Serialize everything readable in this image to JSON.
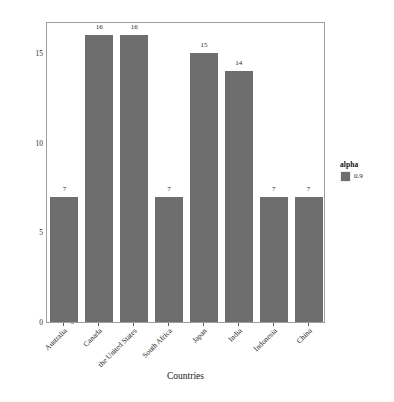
{
  "chart_data": {
    "type": "bar",
    "title": "",
    "xlabel": "Countries",
    "ylabel": "Number of security summits",
    "categories": [
      "Australia",
      "Canada",
      "the United States",
      "South Africa",
      "Japan",
      "India",
      "Indonesia",
      "China"
    ],
    "values": [
      7,
      16,
      16,
      7,
      15,
      14,
      7,
      7
    ],
    "value_labels": [
      "7",
      "16",
      "16",
      "7",
      "15",
      "14",
      "7",
      "7"
    ],
    "ylim": [
      0,
      16.8
    ],
    "yticks": [
      0,
      5,
      10,
      15
    ],
    "ytick_labels": [
      "0",
      "5",
      "10",
      "15"
    ],
    "grid": false,
    "bar_color": "#6e6e6e",
    "panel_border_color": "#9e9e9e",
    "legend": {
      "position": "right",
      "title": "alpha",
      "entries": [
        {
          "label": "0.9",
          "color": "#6e6e6e"
        }
      ]
    }
  }
}
